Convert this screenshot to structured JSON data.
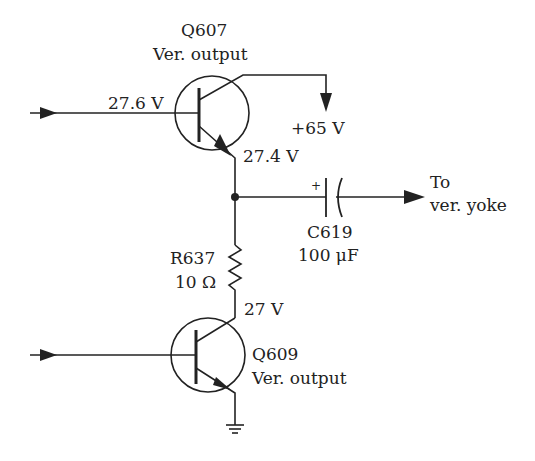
{
  "diagram": {
    "type": "circuit-schematic",
    "components": {
      "q607": {
        "ref": "Q607",
        "desc": "Ver. output",
        "base_voltage": "27.6 V",
        "emitter_voltage": "27.4 V"
      },
      "supply": {
        "label": "+65 V"
      },
      "c619": {
        "ref": "C619",
        "value": "100 μF",
        "polarity": "+"
      },
      "output": {
        "line1": "To",
        "line2": "ver. yoke"
      },
      "r637": {
        "ref": "R637",
        "value": "10 Ω"
      },
      "q609": {
        "ref": "Q609",
        "desc": "Ver. output",
        "collector_voltage": "27 V"
      }
    },
    "colors": {
      "line": "#222222",
      "background": "#ffffff"
    }
  }
}
